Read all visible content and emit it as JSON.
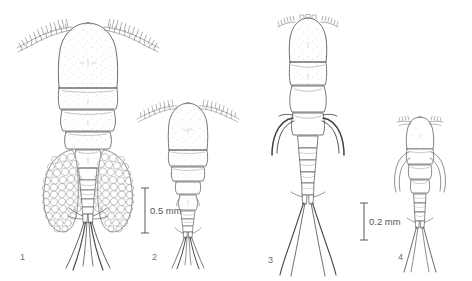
{
  "plate": {
    "background_color": "#ffffff",
    "ink_color": "#5a5a5a",
    "line_color_dark": "#3d3d3d",
    "stipple_color": "#9a9a9a"
  },
  "figures": [
    {
      "number": "1",
      "label_x": 20,
      "label_y": 252,
      "description": "adult female with paired egg sacs, dorsal view"
    },
    {
      "number": "2",
      "label_x": 152,
      "label_y": 252,
      "description": "adult female without egg sacs, dorsal view"
    },
    {
      "number": "3",
      "label_x": 268,
      "label_y": 255,
      "description": "copepodid stage, dorsal view with lateral spines"
    },
    {
      "number": "4",
      "label_x": 398,
      "label_y": 252,
      "description": "early copepodid stage, dorsal view"
    }
  ],
  "scale_bars": [
    {
      "id": "scale-bar-left",
      "value": "0.5 mm",
      "bar_x": 145,
      "bar_top": 188,
      "bar_bottom": 233,
      "label_x": 150,
      "label_y": 205,
      "applies_to": "figures 1 and 2"
    },
    {
      "id": "scale-bar-right",
      "value": "0.2 mm",
      "bar_x": 364,
      "bar_top": 203,
      "bar_bottom": 240,
      "label_x": 369,
      "label_y": 216,
      "applies_to": "figures 3 and 4"
    }
  ]
}
